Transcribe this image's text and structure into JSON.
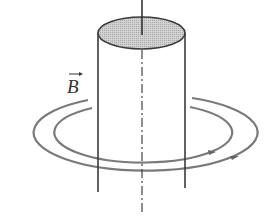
{
  "figure": {
    "label_field": "B",
    "label_field_is_vector": true,
    "colors": {
      "stroke": "#333333",
      "field_lines": "#777777",
      "top_fill": "#c9c9c9",
      "background": "#ffffff"
    },
    "elements": {
      "conductor": "cylinder",
      "axis": "dash-dot central axis",
      "top_rod": "wire lead entering top face",
      "field_lines": 2,
      "field_direction": "counterclockwise viewed from above (arrows pointing right at front)"
    }
  }
}
